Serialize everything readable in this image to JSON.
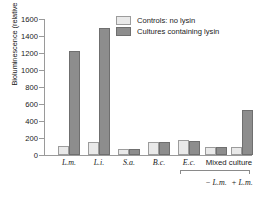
{
  "chart_data": {
    "type": "bar",
    "title": "",
    "xlabel": "",
    "ylabel": "Bioluminescence (relative light units)",
    "ylim": [
      0,
      1600
    ],
    "ytick_labels": [
      "1600",
      "1400",
      "1200",
      "1000",
      "800",
      "600",
      "400",
      "200",
      "0"
    ],
    "ytick_values": [
      1600,
      1400,
      1200,
      1000,
      800,
      600,
      400,
      200,
      0
    ],
    "grid": false,
    "legend_position": "top-center",
    "categories": [
      "L.m.",
      "L.i.",
      "S.a.",
      "B.c.",
      "E.c.",
      "Mixed culture - L.m.",
      "Mixed culture + L.m."
    ],
    "category_labels": [
      "L.m.",
      "L.i.",
      "S.a.",
      "B.c.",
      "E.c."
    ],
    "group_label": "Mixed culture",
    "sub_labels": [
      "− L.m.",
      "+ L.m."
    ],
    "series": [
      {
        "name": "Controls: no lysin",
        "color": "#e9e9e9",
        "values": [
          110,
          150,
          70,
          155,
          175,
          90,
          100
        ]
      },
      {
        "name": "Cultures containing lysin",
        "color": "#8d8d8d",
        "values": [
          1220,
          1490,
          70,
          150,
          170,
          90,
          530
        ]
      }
    ]
  },
  "legend": {
    "entries": [
      {
        "label": "Controls: no lysin",
        "swatch": "light-gray-swatch"
      },
      {
        "label": "Cultures containing lysin",
        "swatch": "dark-gray-swatch"
      }
    ]
  },
  "axes": {
    "y_title": "Bioluminescence (relative light units)",
    "y_ticks": [
      "1600",
      "1400",
      "1200",
      "1000",
      "800",
      "600",
      "400",
      "200",
      "0"
    ]
  },
  "x_axis": {
    "labels": [
      "L.m.",
      "L.i.",
      "S.a.",
      "B.c.",
      "E.c."
    ],
    "mixed_culture_label": "Mixed culture",
    "mixed_sub_labels": [
      "− L.m.",
      "+ L.m."
    ]
  }
}
